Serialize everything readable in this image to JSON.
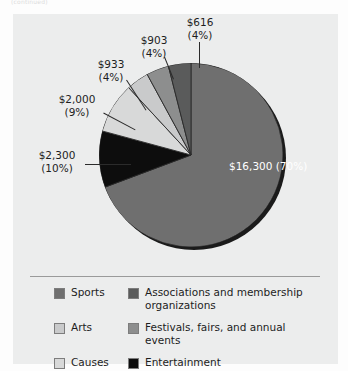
{
  "top_caption": "(continued)",
  "chart_data": {
    "type": "pie",
    "title": "",
    "legend_position": "bottom",
    "currency": "$",
    "total": 23052,
    "categories": [
      "Sports",
      "Entertainment",
      "Causes",
      "Arts",
      "Festivals, fairs, and annual events",
      "Associations and membership organizations"
    ],
    "values": [
      16300,
      2300,
      2000,
      933,
      903,
      616
    ],
    "percents": [
      70,
      10,
      9,
      4,
      4,
      4
    ],
    "labels": [
      "$16,300",
      "$2,300",
      "$2,000",
      "$933",
      "$903",
      "$616"
    ],
    "percent_labels": [
      "(70%)",
      "(10%)",
      "(9%)",
      "(4%)",
      "(4%)",
      "(4%)"
    ],
    "colors": [
      "#6f6f6f",
      "#0d0d0d",
      "#d8d9d9",
      "#c9cacb",
      "#8d8e8e",
      "#5a5b5b"
    ],
    "slices": [
      {
        "name": "Sports",
        "value": 16300,
        "percent": 70,
        "amount_label": "$16,300",
        "percent_label": "(70%)",
        "color": "#6f6f6f"
      },
      {
        "name": "Entertainment",
        "value": 2300,
        "percent": 10,
        "amount_label": "$2,300",
        "percent_label": "(10%)",
        "color": "#0d0d0d"
      },
      {
        "name": "Causes",
        "value": 2000,
        "percent": 9,
        "amount_label": "$2,000",
        "percent_label": "(9%)",
        "color": "#d8d9d9"
      },
      {
        "name": "Arts",
        "value": 933,
        "percent": 4,
        "amount_label": "$933",
        "percent_label": "(4%)",
        "color": "#c9cacb"
      },
      {
        "name": "Festivals, fairs, and annual events",
        "value": 903,
        "percent": 4,
        "amount_label": "$903",
        "percent_label": "(4%)",
        "color": "#8d8e8e"
      },
      {
        "name": "Associations and membership organizations",
        "value": 616,
        "percent": 4,
        "amount_label": "$616",
        "percent_label": "(4%)",
        "color": "#5a5b5b"
      }
    ]
  },
  "callouts": {
    "c616": {
      "amount": "$616",
      "percent": "(4%)"
    },
    "c903": {
      "amount": "$903",
      "percent": "(4%)"
    },
    "c933": {
      "amount": "$933",
      "percent": "(4%)"
    },
    "c2000": {
      "amount": "$2,000",
      "percent": "(9%)"
    },
    "c2300": {
      "amount": "$2,300",
      "percent": "(10%)"
    },
    "inner": {
      "amount": "$16,300",
      "percent": "(70%)"
    }
  },
  "legend": {
    "items": [
      {
        "label": "Sports",
        "color": "#6f6f6f"
      },
      {
        "label": "Associations and membership organizations",
        "color": "#5a5b5b"
      },
      {
        "label": "Arts",
        "color": "#c9cacb"
      },
      {
        "label": "Festivals, fairs, and annual events",
        "color": "#8d8e8e"
      },
      {
        "label": "Causes",
        "color": "#d8d9d9"
      },
      {
        "label": "Entertainment",
        "color": "#0d0d0d"
      }
    ]
  }
}
